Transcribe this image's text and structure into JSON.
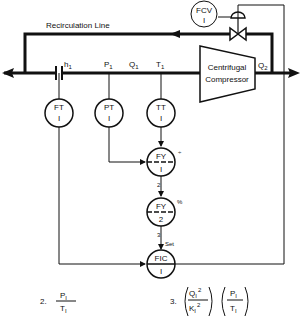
{
  "diagram": {
    "type": "process-instrumentation",
    "recirculation_label": "Recirculation Line",
    "compressor": {
      "line1": "Centrifugal",
      "line2": "Compressor"
    },
    "stream_labels": {
      "h1": "h",
      "h1_sub": "1",
      "p1": "P",
      "p1_sub": "1",
      "q1": "Q",
      "q1_sub": "1",
      "t1": "T",
      "t1_sub": "1",
      "q2": "Q",
      "q2_sub": "2"
    },
    "instruments": {
      "fcv": {
        "tag": "FCV",
        "num": "I"
      },
      "ft": {
        "tag": "FT",
        "num": "I"
      },
      "pt": {
        "tag": "PT",
        "num": "I"
      },
      "tt": {
        "tag": "TT",
        "num": "I"
      },
      "fy1": {
        "tag": "FY",
        "num": "I",
        "func": "÷"
      },
      "fy2": {
        "tag": "FY",
        "num": "2",
        "func": "%"
      },
      "fic": {
        "tag": "FIC",
        "num": "I"
      }
    },
    "signal_labels": {
      "sig2": "2",
      "sig3": "3",
      "set": "Set"
    },
    "equations": {
      "eq2_num": "2.",
      "eq2_top": "P",
      "eq2_top_sub": "I",
      "eq2_bot": "T",
      "eq2_bot_sub": "I",
      "eq3_num": "3.",
      "eq3_q": "Q",
      "eq3_q_sub": "I",
      "eq3_q_sup": "2",
      "eq3_k": "K",
      "eq3_k_sub": "I",
      "eq3_k_sup": "2",
      "eq3_p": "P",
      "eq3_p_sub": "I",
      "eq3_t": "T",
      "eq3_t_sub": "I"
    }
  }
}
